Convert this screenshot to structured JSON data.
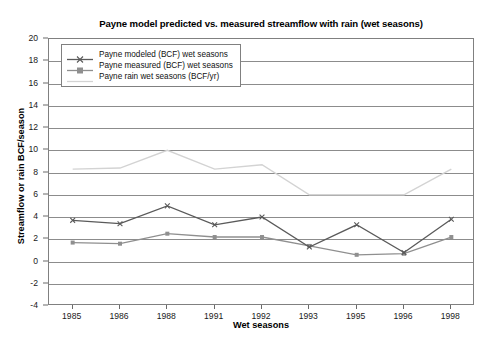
{
  "chart_data": {
    "type": "line",
    "title": "Payne model predicted vs. measured streamflow with rain (wet seasons)",
    "xlabel": "Wet seasons",
    "ylabel": "Streamflow or rain BCF/season",
    "categories": [
      "1985",
      "1986",
      "1988",
      "1991",
      "1992",
      "1993",
      "1995",
      "1996",
      "1998"
    ],
    "ylim": [
      -4,
      20
    ],
    "ytick_step": 2,
    "yticks": [
      20,
      18,
      16,
      14,
      12,
      10,
      8,
      6,
      4,
      2,
      0,
      -2,
      -4
    ],
    "ytick_labels": [
      "20",
      "18",
      "16",
      "14",
      "12",
      "10",
      "8",
      "6",
      "4",
      "2",
      "0",
      "-2",
      "-4"
    ],
    "grid": true,
    "legend_position": "upper-left-inside",
    "series": [
      {
        "name": "Payne modeled (BCF) wet seasons",
        "values": [
          3.7,
          3.4,
          5.0,
          3.3,
          4.0,
          1.3,
          3.3,
          0.8,
          3.8
        ],
        "color": "#5a5a5a",
        "marker": "x"
      },
      {
        "name": "Payne measured (BCF) wet seasons",
        "values": [
          1.7,
          1.6,
          2.5,
          2.2,
          2.2,
          1.4,
          0.6,
          0.7,
          2.2
        ],
        "color": "#8f8f8f",
        "marker": "square"
      },
      {
        "name": "Payne rain wet seasons (BCF/yr)",
        "values": [
          8.3,
          8.4,
          10.0,
          8.3,
          8.7,
          6.0,
          6.0,
          6.0,
          8.3
        ],
        "color": "#d3d3d3",
        "marker": "none"
      }
    ]
  }
}
